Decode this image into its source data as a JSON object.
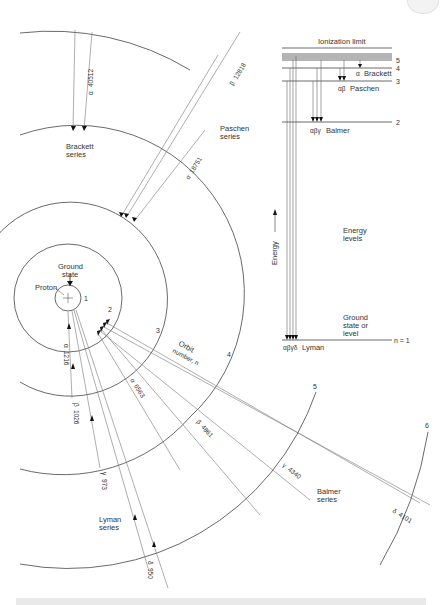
{
  "orbit_diagram": {
    "center_labels": {
      "ground_state": [
        "Ground",
        "state"
      ],
      "proton": "Proton",
      "orbit_number": [
        "Orbit",
        "number, n"
      ]
    },
    "orbit_numbers": [
      "1",
      "2",
      "3",
      "4",
      "5",
      "6"
    ],
    "series_labels": {
      "brackett": [
        "Brackett",
        "series"
      ],
      "paschen": [
        "Paschen",
        "series"
      ],
      "balmer": [
        "Balmer",
        "series"
      ],
      "lyman": [
        "Lyman",
        "series"
      ]
    },
    "lines": [
      {
        "series": "Brackett",
        "symbol": "α",
        "wavelength": "40512"
      },
      {
        "series": "Paschen",
        "symbol": "α",
        "wavelength": "18751"
      },
      {
        "series": "Paschen",
        "symbol": "β",
        "wavelength": "12818"
      },
      {
        "series": "Balmer",
        "symbol": "α",
        "wavelength": "6563"
      },
      {
        "series": "Balmer",
        "symbol": "β",
        "wavelength": "4861"
      },
      {
        "series": "Balmer",
        "symbol": "γ",
        "wavelength": "4340"
      },
      {
        "series": "Balmer",
        "symbol": "δ",
        "wavelength": "4101"
      },
      {
        "series": "Lyman",
        "symbol": "α",
        "wavelength": "1216"
      },
      {
        "series": "Lyman",
        "symbol": "β",
        "wavelength": "1026"
      },
      {
        "series": "Lyman",
        "symbol": "γ",
        "wavelength": "973"
      },
      {
        "series": "Lyman",
        "symbol": "δ",
        "wavelength": "950"
      }
    ]
  },
  "energy_diagram": {
    "ionization_label": "Ionization limit",
    "levels": [
      "5",
      "4",
      "3",
      "2",
      "n = 1"
    ],
    "series": {
      "brackett": {
        "symbol": "α",
        "name": "Brackett"
      },
      "paschen": {
        "symbol": "αβ",
        "name": "Paschen"
      },
      "balmer": {
        "symbol": "αβγ",
        "name": "Balmer"
      },
      "lyman": {
        "symbol": "αβγδ",
        "name": "Lyman"
      }
    },
    "axis_label": "Energy",
    "energy_levels_label": [
      "Energy",
      "levels"
    ],
    "ground_label": [
      "Ground",
      "state or",
      "level"
    ]
  }
}
